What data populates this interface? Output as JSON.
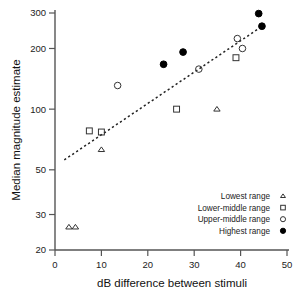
{
  "chart_data": {
    "type": "scatter",
    "title": "",
    "xlabel": "dB difference between stimuli",
    "ylabel": "Median magnitude estimate",
    "xlim": [
      0,
      50
    ],
    "ylim": [
      20,
      300
    ],
    "yscale": "log",
    "xscale": "linear",
    "grid": false,
    "xticks": [
      0,
      10,
      20,
      30,
      40,
      50
    ],
    "yticks": [
      20,
      30,
      50,
      100,
      200,
      300
    ],
    "legend_position": "lower-right",
    "series": [
      {
        "name": "Lowest range",
        "marker": "open-triangle",
        "points": [
          {
            "x": 3.0,
            "y": 26
          },
          {
            "x": 4.4,
            "y": 26
          },
          {
            "x": 10.0,
            "y": 63
          },
          {
            "x": 34.9,
            "y": 100
          }
        ]
      },
      {
        "name": "Lower-middle range",
        "marker": "open-square",
        "points": [
          {
            "x": 7.4,
            "y": 78
          },
          {
            "x": 10.0,
            "y": 77
          },
          {
            "x": 26.2,
            "y": 100
          },
          {
            "x": 39.0,
            "y": 180
          }
        ]
      },
      {
        "name": "Upper-middle range",
        "marker": "open-circle",
        "points": [
          {
            "x": 13.5,
            "y": 131
          },
          {
            "x": 31.0,
            "y": 158
          },
          {
            "x": 39.3,
            "y": 224
          },
          {
            "x": 40.4,
            "y": 200
          }
        ]
      },
      {
        "name": "Highest range",
        "marker": "filled-circle",
        "points": [
          {
            "x": 23.4,
            "y": 167
          },
          {
            "x": 27.6,
            "y": 192
          },
          {
            "x": 43.9,
            "y": 298
          },
          {
            "x": 44.6,
            "y": 258
          }
        ]
      }
    ],
    "trendline": {
      "label": "fitted regression line",
      "style": "dashed",
      "x_start": 2.0,
      "y_start": 56,
      "x_end": 44.0,
      "y_end": 252
    },
    "annotations": []
  },
  "legend": {
    "entries": [
      {
        "label": "Lowest range",
        "marker": "open-triangle-icon"
      },
      {
        "label": "Lower-middle range",
        "marker": "open-square-icon"
      },
      {
        "label": "Upper-middle range",
        "marker": "open-circle-icon"
      },
      {
        "label": "Highest range",
        "marker": "filled-circle-icon"
      }
    ]
  },
  "axes": {
    "x_tick_labels": [
      "0",
      "10",
      "20",
      "30",
      "40",
      "50"
    ],
    "y_tick_labels": [
      "20",
      "30",
      "50",
      "100",
      "200",
      "300"
    ],
    "x_title": "dB difference between stimuli",
    "y_title": "Median magnitude estimate"
  }
}
